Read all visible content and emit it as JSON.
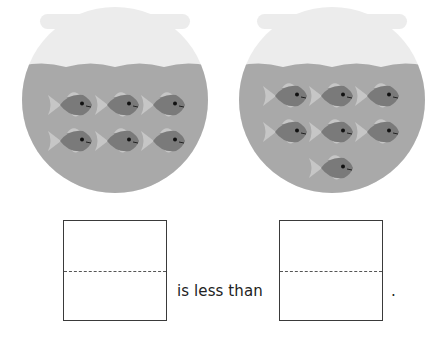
{
  "worksheet": {
    "bowls": [
      {
        "name": "left-bowl",
        "fish_count": 6,
        "rows": [
          3,
          3
        ]
      },
      {
        "name": "right-bowl",
        "fish_count": 7,
        "rows": [
          3,
          3,
          1
        ]
      }
    ],
    "sentence": {
      "comparison_text": "is less than",
      "end_punctuation": ".",
      "first_box_value": "",
      "second_box_value": ""
    },
    "colors": {
      "glass": "#ececec",
      "water": "#a9a9a9",
      "fish_body": "#7a7a7a",
      "fish_fin": "#c6c6c6",
      "fish_eye": "#111111",
      "box_border": "#3a3a3a"
    }
  }
}
